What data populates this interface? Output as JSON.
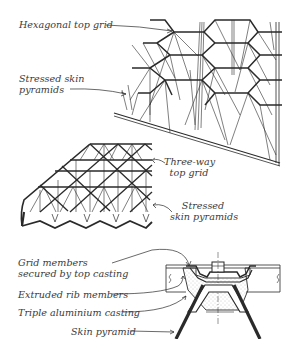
{
  "figure": {
    "colors": {
      "ink": "#2a2a2a",
      "text": "#3a3a3a",
      "stipple": "#9a9a9a",
      "background": "#ffffff"
    },
    "panels": [
      {
        "id": "hexagonal-space-frame",
        "labels": [
          {
            "id": "hexagonal-top-grid",
            "lines": [
              "Hexagonal top grid"
            ]
          },
          {
            "id": "stressed-skin-pyramids-1",
            "lines": [
              "Stressed skin",
              "pyramids"
            ]
          }
        ]
      },
      {
        "id": "three-way-space-frame",
        "labels": [
          {
            "id": "three-way-top-grid",
            "lines": [
              "Three-way",
              "top grid"
            ]
          },
          {
            "id": "stressed-skin-pyramids-2",
            "lines": [
              "Stressed",
              "skin pyramids"
            ]
          }
        ]
      },
      {
        "id": "node-section-detail",
        "labels": [
          {
            "id": "grid-members-secured",
            "lines": [
              "Grid members",
              "secured by top casting"
            ]
          },
          {
            "id": "extruded-rib-members",
            "lines": [
              "Extruded rib members"
            ]
          },
          {
            "id": "triple-aluminium-casting",
            "lines": [
              "Triple aluminium casting"
            ]
          },
          {
            "id": "skin-pyramid",
            "lines": [
              "Skin pyramid"
            ]
          }
        ]
      }
    ]
  }
}
